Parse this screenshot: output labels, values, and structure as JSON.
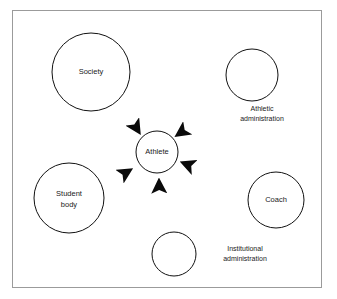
{
  "diagram": {
    "type": "hub-and-spoke influence diagram",
    "title": "",
    "frame": {
      "border_color": "#9b9b9b",
      "background_color": "#ffffff"
    },
    "colors": {
      "node_stroke": "#111111",
      "node_fill": "#ffffff",
      "arrow": "#0a0a0a",
      "text": "#1a1a1a"
    },
    "center": {
      "id": "athlete",
      "label": "Athlete",
      "cx": 157,
      "cy": 152,
      "r": 21,
      "font_size": 7.5,
      "label_position": "inside"
    },
    "nodes": [
      {
        "id": "society",
        "label": "Society",
        "cx": 91,
        "cy": 72,
        "r": 39,
        "font_size": 7.5,
        "label_position": "inside",
        "label_lines": [
          "Society"
        ]
      },
      {
        "id": "athletic-administration",
        "label": "Athletic administration",
        "cx": 252,
        "cy": 75,
        "r": 26,
        "font_size": 7,
        "label_position": "outside-below",
        "label_lines": [
          "Athletic",
          "administration"
        ],
        "label_x": 262,
        "label_y": 113
      },
      {
        "id": "coach",
        "label": "Coach",
        "cx": 276,
        "cy": 200,
        "r": 28,
        "font_size": 7.5,
        "label_position": "inside",
        "label_lines": [
          "Coach"
        ]
      },
      {
        "id": "institutional-administration",
        "label": "Institutional administration",
        "cx": 174,
        "cy": 254,
        "r": 22,
        "font_size": 7,
        "label_position": "outside-right",
        "label_lines": [
          "Institutional",
          "administration"
        ],
        "label_x": 245,
        "label_y": 254
      },
      {
        "id": "student-body",
        "label": "Student body",
        "cx": 69,
        "cy": 198,
        "r": 35,
        "font_size": 7.5,
        "label_position": "inside",
        "label_lines": [
          "Student",
          "body"
        ]
      }
    ],
    "edges": [
      {
        "id": "society-to-athlete",
        "from": "society",
        "to": "athlete",
        "direction": "unidirectional",
        "arrowhead": "solid-triangle",
        "x1": 119,
        "y1": 100,
        "x2": 142,
        "y2": 137
      },
      {
        "id": "athletic-administration-to-athlete",
        "from": "athletic-administration",
        "to": "athlete",
        "direction": "unidirectional",
        "arrowhead": "solid-triangle",
        "x1": 234,
        "y1": 96,
        "x2": 173,
        "y2": 138
      },
      {
        "id": "coach-to-athlete",
        "from": "coach",
        "to": "athlete",
        "direction": "unidirectional",
        "arrowhead": "solid-triangle",
        "x1": 250,
        "y1": 189,
        "x2": 178,
        "y2": 161
      },
      {
        "id": "institutional-administration-to-athlete",
        "from": "institutional-administration",
        "to": "athlete",
        "direction": "unidirectional",
        "arrowhead": "solid-triangle",
        "x1": 160,
        "y1": 232,
        "x2": 158,
        "y2": 175
      },
      {
        "id": "student-body-to-athlete",
        "from": "student-body",
        "to": "athlete",
        "direction": "unidirectional",
        "arrowhead": "solid-triangle",
        "x1": 101,
        "y1": 188,
        "x2": 136,
        "y2": 166
      }
    ]
  }
}
